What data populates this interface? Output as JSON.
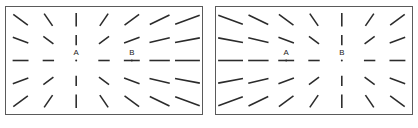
{
  "figure": {
    "name": "radial-line-illusion-pair",
    "width": 418,
    "height": 128,
    "background_color": "#ffffff",
    "line_color": "#2b2b2b",
    "border_color": "#5a5a5a",
    "label_color": "#1a1a1a"
  },
  "panels": [
    {
      "id": "left",
      "name": "left-panel",
      "x": 5,
      "y": 6,
      "width": 198,
      "height": 109,
      "focus_label": "A",
      "focus_col": 2,
      "focus_row": 2,
      "markers": [
        {
          "label": "A",
          "col": 2,
          "row": 2
        },
        {
          "label": "B",
          "col": 4,
          "row": 2
        }
      ]
    },
    {
      "id": "right",
      "name": "right-panel",
      "x": 215,
      "y": 6,
      "width": 198,
      "height": 109,
      "focus_label": "B",
      "focus_col": 4,
      "focus_row": 2,
      "markers": [
        {
          "label": "A",
          "col": 2,
          "row": 2
        },
        {
          "label": "B",
          "col": 4,
          "row": 2
        }
      ]
    }
  ],
  "grid": {
    "cols": 7,
    "rows": 5,
    "margin_x": 14,
    "margin_y": 13,
    "base_length": 7,
    "length_gain": 4.6,
    "max_length": 30,
    "stroke_width": 1.6,
    "dot_radius": 1.0,
    "label_offset_y": -6
  }
}
